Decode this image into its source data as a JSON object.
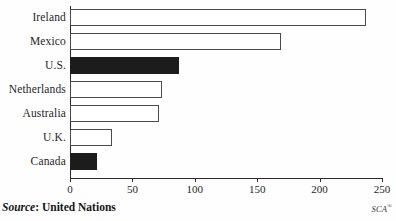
{
  "chart_data": {
    "type": "bar",
    "orientation": "horizontal",
    "title": "",
    "subtitle": "",
    "xlabel": "",
    "ylabel": "",
    "categories": [
      "Ireland",
      "Mexico",
      "U.S.",
      "Netherlands",
      "Australia",
      "U.K.",
      "Canada"
    ],
    "values": [
      237,
      169,
      87,
      74,
      71,
      34,
      22
    ],
    "series": [
      {
        "name": "",
        "values": [
          237,
          169,
          87,
          74,
          71,
          34,
          22
        ]
      }
    ],
    "bar_styles": [
      "open",
      "open",
      "filled",
      "open",
      "open",
      "open",
      "filled"
    ],
    "xlim": [
      0,
      250
    ],
    "xticks": [
      0,
      50,
      100,
      150,
      200,
      250
    ],
    "xtick_labels": [
      "0",
      "50",
      "100",
      "150",
      "200",
      "250"
    ],
    "grid": false,
    "legend": "none",
    "colors": {
      "filled_bar": "#1c1c1c",
      "open_bar_fill": "#ffffff",
      "bar_outline": "#4a4a4a",
      "axis": "#2b2b2b",
      "text": "#1f1f1f",
      "background": "#fefefe"
    }
  },
  "footer": {
    "source_prefix": "Source",
    "source_separator": ": ",
    "source_value": "United Nations",
    "mark_text": "SCA",
    "mark_symbol": "®"
  }
}
